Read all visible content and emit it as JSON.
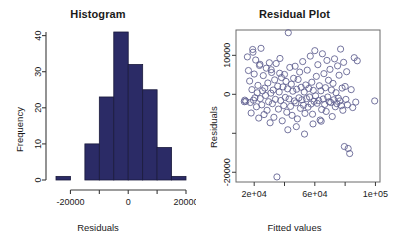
{
  "figure": {
    "background": "#ffffff",
    "panels": [
      "histogram",
      "residual-plot"
    ]
  },
  "histogram": {
    "title": "Histogram",
    "xlabel": "Residuals",
    "ylabel": "Frequency"
  },
  "residual": {
    "title": "Residual Plot",
    "xlabel": "Fitted values",
    "ylabel": "Residuals"
  },
  "chart_data": [
    {
      "type": "bar",
      "id": "histogram",
      "title": "Histogram",
      "xlabel": "Residuals",
      "ylabel": "Frequency",
      "bar_color": "#2b2b66",
      "bar_edge_color": "#1a1a3c",
      "bin_width": 5000,
      "bin_edges": [
        -25000,
        -20000,
        -15000,
        -10000,
        -5000,
        0,
        5000,
        10000,
        15000,
        20000
      ],
      "bin_centers": [
        -22500,
        -17500,
        -12500,
        -7500,
        -2500,
        2500,
        7500,
        12500,
        17500
      ],
      "values": [
        1,
        0,
        10,
        23,
        41,
        32,
        25,
        9,
        1
      ],
      "categories": [
        "-25000:-20000",
        "-20000:-15000",
        "-15000:-10000",
        "-10000:-5000",
        "-5000:0",
        "0:5000",
        "5000:10000",
        "10000:15000",
        "15000:20000"
      ],
      "xlim": [
        -25000,
        20000
      ],
      "ylim": [
        0,
        41
      ],
      "xticks": [
        -20000,
        -10000,
        0,
        10000,
        20000
      ],
      "xticklabels": [
        "-20000",
        "",
        "0",
        "",
        "20000"
      ],
      "yticks": [
        0,
        10,
        20,
        30,
        40
      ],
      "yticklabels": [
        "0",
        "10",
        "20",
        "30",
        "40"
      ],
      "grid": false,
      "legend": "none",
      "box_style": "L-shaped axes (left and bottom only)"
    },
    {
      "type": "scatter",
      "id": "residual-plot",
      "title": "Residual Plot",
      "xlabel": "Fitted values",
      "ylabel": "Residuals",
      "marker": "open-circle",
      "marker_color": "#5c5c8e",
      "marker_size": 3.1,
      "xlim": [
        8000,
        103000
      ],
      "ylim": [
        -22500,
        16500
      ],
      "xticks": [
        20000,
        40000,
        60000,
        80000,
        100000
      ],
      "xticklabels": [
        "2e+04",
        "",
        "6e+04",
        "",
        "1e+05"
      ],
      "yticks": [
        -20000,
        -10000,
        0,
        10000
      ],
      "yticklabels": [
        "-20000",
        "",
        "0",
        "10000"
      ],
      "grid": false,
      "legend": "none",
      "box_style": "full box frame",
      "n_points": 152,
      "x": [
        14500,
        15500,
        16200,
        17000,
        17500,
        18000,
        18500,
        19000,
        19500,
        20000,
        20500,
        21000,
        21500,
        22000,
        22500,
        23000,
        23500,
        24000,
        24500,
        25000,
        25500,
        26000,
        26500,
        27000,
        27500,
        28000,
        28500,
        29000,
        29500,
        30000,
        30500,
        31000,
        31500,
        32000,
        32500,
        33000,
        33500,
        34000,
        34500,
        35000,
        35500,
        36000,
        36500,
        37000,
        37500,
        38000,
        38500,
        39000,
        39500,
        40000,
        40500,
        41000,
        41500,
        42000,
        42500,
        43000,
        43500,
        44000,
        44500,
        45000,
        45500,
        46000,
        46500,
        47000,
        47500,
        48000,
        48500,
        49000,
        49500,
        50000,
        50500,
        51000,
        51500,
        52000,
        52500,
        53000,
        53500,
        54000,
        54500,
        55000,
        55500,
        56000,
        56500,
        57000,
        57500,
        58000,
        58500,
        59000,
        59500,
        60000,
        60500,
        61000,
        61500,
        62000,
        62500,
        63000,
        63500,
        64000,
        64500,
        65000,
        65500,
        66000,
        66500,
        67000,
        67500,
        68000,
        68500,
        69000,
        69500,
        70000,
        70500,
        71000,
        71500,
        72000,
        72500,
        73000,
        73500,
        74000,
        74500,
        75000,
        75500,
        76000,
        76500,
        77000,
        77500,
        78000,
        78500,
        79000,
        79500,
        80000,
        80500,
        81000,
        81500,
        82000,
        83000,
        84000,
        85000,
        86000,
        87000,
        88000,
        13500,
        13800,
        19200,
        23800,
        31200,
        36800,
        42200,
        47800,
        53200,
        58800,
        64200,
        99500
      ],
      "y": [
        -1800,
        9600,
        6100,
        3400,
        -2100,
        -4800,
        1200,
        11500,
        -1500,
        5200,
        -900,
        8800,
        -3200,
        400,
        2300,
        -6100,
        7400,
        -1100,
        11800,
        -2700,
        900,
        4800,
        -5200,
        1600,
        -300,
        6700,
        -4100,
        2900,
        -1900,
        8100,
        -7300,
        300,
        5600,
        -2400,
        1100,
        -5900,
        3700,
        -1300,
        7900,
        -21200,
        2100,
        -3800,
        600,
        9200,
        -1600,
        4300,
        -6800,
        1900,
        -2900,
        5100,
        -800,
        3300,
        -4600,
        1400,
        15800,
        -1200,
        6900,
        -3100,
        2600,
        -5400,
        800,
        4100,
        -1700,
        7200,
        -2200,
        1300,
        -6300,
        3800,
        -900,
        5700,
        -3600,
        1800,
        -1400,
        8400,
        -2800,
        600,
        -4900,
        2400,
        -1100,
        6200,
        -3300,
        1500,
        -700,
        9800,
        -2500,
        3100,
        -5100,
        1000,
        -1800,
        11200,
        -400,
        4600,
        -2300,
        7600,
        -1600,
        2200,
        -6600,
        900,
        -3900,
        10400,
        -1200,
        5300,
        -2600,
        1700,
        -4400,
        8700,
        -700,
        3600,
        -1900,
        6400,
        -2100,
        1100,
        -5700,
        2800,
        -1400,
        9100,
        -3200,
        400,
        -2400,
        7300,
        -1000,
        4900,
        -1700,
        11600,
        -2900,
        1600,
        -4100,
        8200,
        -13400,
        2000,
        -1300,
        5800,
        -2700,
        -13900,
        -15200,
        1200,
        -3400,
        9400,
        -2000,
        8600,
        -1900,
        -1500,
        10800,
        7700,
        6300,
        5400,
        -9100,
        -8300,
        -10200,
        -7600,
        -6900,
        -1700
      ]
    }
  ]
}
